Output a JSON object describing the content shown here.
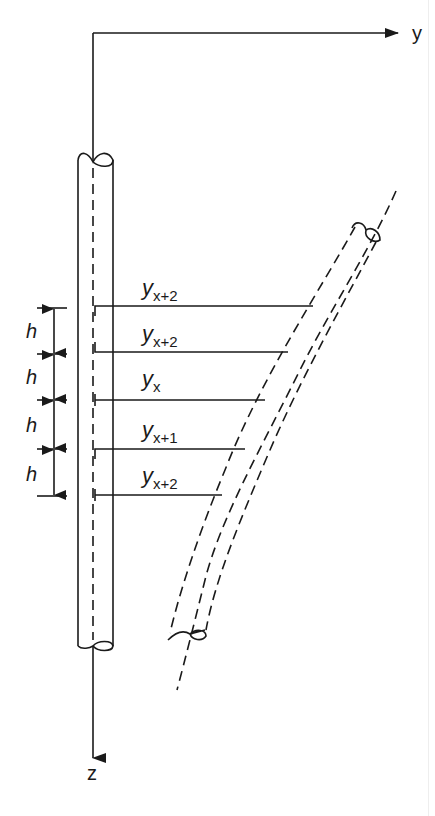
{
  "diagram": {
    "type": "pile deflection discretization",
    "colors": {
      "ink": "#1a1a1a",
      "background": "#ffffff"
    },
    "axes": {
      "y_label": "y",
      "z_label": "z",
      "origin": [
        93,
        33
      ],
      "y_axis_end": [
        400,
        33
      ],
      "z_axis_end": [
        93,
        760
      ]
    },
    "spacing_label": "h",
    "spacing_count": 4,
    "ticks_y": [
      308,
      354,
      400,
      449,
      496
    ],
    "stations": [
      {
        "label_base": "y",
        "label_sub": "x+2",
        "line_y": 306,
        "line_end_x": 313,
        "label_y": 293
      },
      {
        "label_base": "y",
        "label_sub": "x+2",
        "line_y": 352,
        "line_end_x": 288,
        "label_y": 340
      },
      {
        "label_base": "y",
        "label_sub": "x",
        "line_y": 400,
        "line_end_x": 265,
        "label_y": 385
      },
      {
        "label_base": "y",
        "label_sub": "x+1",
        "line_y": 449,
        "line_end_x": 245,
        "label_y": 436
      },
      {
        "label_base": "y",
        "label_sub": "x+2",
        "line_y": 495,
        "line_end_x": 222,
        "label_y": 482
      }
    ],
    "original_pile": {
      "left_x": 78,
      "right_x": 113,
      "top_y": 160,
      "bottom_y": 645,
      "centerline_x": 93
    },
    "deflected_pile": {
      "description": "curved dashed pile deflected to the right"
    }
  }
}
